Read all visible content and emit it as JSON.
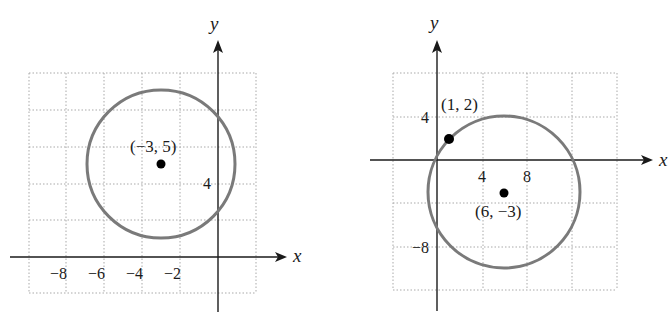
{
  "figures": [
    {
      "id": "left",
      "x_axis_label": "x",
      "y_axis_label": "y",
      "x_ticks": [
        "−8",
        "−6",
        "−4",
        "−2"
      ],
      "y_ticks": [
        "4"
      ],
      "center_label": "(−3, 5)",
      "center": [
        -3,
        5
      ],
      "grid_step": 2
    },
    {
      "id": "right",
      "x_axis_label": "x",
      "y_axis_label": "y",
      "x_ticks": [
        "4",
        "8"
      ],
      "y_ticks": [
        "4",
        "−8"
      ],
      "center_label": "(6, −3)",
      "point_label": "(1, 2)",
      "center": [
        6,
        -3
      ],
      "point_on_circle": [
        1,
        2
      ],
      "grid_step": 4
    }
  ],
  "colors": {
    "circle": "#7a7a7a",
    "grid": "#a9a9a9",
    "axis": "#1a1a1a"
  }
}
